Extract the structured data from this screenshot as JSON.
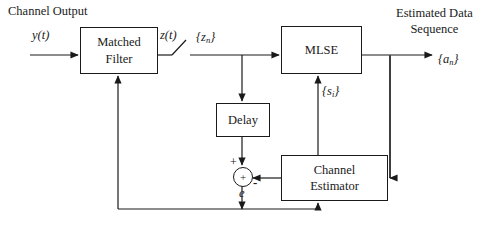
{
  "diagram": {
    "title_label": "Channel Output",
    "blocks": [
      {
        "id": "matched-filter",
        "line1": "Matched",
        "line2": "Filter"
      },
      {
        "id": "mlse",
        "line1": "MLSE",
        "line2": ""
      },
      {
        "id": "delay",
        "line1": "Delay",
        "line2": ""
      },
      {
        "id": "channel-estimator",
        "line1": "Channel",
        "line2": "Estimator"
      }
    ],
    "signals": {
      "input_yt": "y(t)",
      "filter_output_zt": "z(t)",
      "sampled_zn": "{z",
      "sampled_zn_sub": "n",
      "sampled_zn_close": "}",
      "channel_estimate": "{s",
      "channel_estimate_sub": "i",
      "channel_estimate_close": "}",
      "output_sequence_line1": "Estimated Data",
      "output_sequence_line2": "Sequence",
      "output_symbols": "{a",
      "output_symbols_sub": "n",
      "output_symbols_close": "}",
      "error_signal": "e",
      "sum_plus_input": "+",
      "sum_minus_input": "-",
      "sum_operator": "+"
    },
    "colors": {
      "line": "#1a1a1a",
      "background": "#ffffff",
      "text": "#1a1a1a"
    }
  }
}
